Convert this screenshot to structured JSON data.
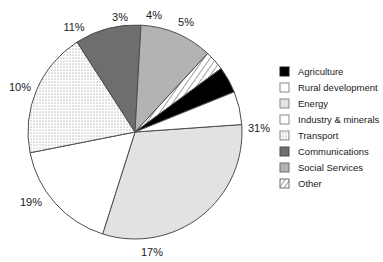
{
  "chart_data": {
    "type": "pie",
    "title": "",
    "legend_position": "right",
    "categories": [
      "Agriculture",
      "Rural development",
      "Energy",
      "Industry & minerals",
      "Transport",
      "Communications",
      "Social Services",
      "Other"
    ],
    "values": [
      4,
      5,
      31,
      17,
      19,
      10,
      11,
      3
    ],
    "value_labels": [
      "4%",
      "5%",
      "31%",
      "17%",
      "19%",
      "10%",
      "11%",
      "3%"
    ],
    "units": "percent",
    "total": 100,
    "slice_styles": [
      "solid-black",
      "white",
      "light-gray",
      "white",
      "dotted",
      "dark-gray",
      "medium-gray",
      "diagonal-hatch"
    ],
    "colors": {
      "agriculture": "#000000",
      "rural_development": "#ffffff",
      "energy": "#e2e2e2",
      "industry_minerals": "#ffffff",
      "transport": "#f2f2f2",
      "communications": "#6e6e6e",
      "social_services": "#b3b3b3",
      "other": "#ffffff",
      "outline": "#4d4d4d",
      "text": "#1a1a1a"
    },
    "start_angle_deg": -4,
    "direction": "clockwise"
  },
  "legend": {
    "items": [
      {
        "label": "Agriculture",
        "swatch": "solid-black-swatch"
      },
      {
        "label": "Rural development",
        "swatch": "white-swatch"
      },
      {
        "label": "Energy",
        "swatch": "light-gray-swatch"
      },
      {
        "label": "Industry & minerals",
        "swatch": "white-swatch"
      },
      {
        "label": "Transport",
        "swatch": "dotted-swatch"
      },
      {
        "label": "Communications",
        "swatch": "dark-gray-swatch"
      },
      {
        "label": "Social Services",
        "swatch": "medium-gray-swatch"
      },
      {
        "label": "Other",
        "swatch": "diagonal-hatch-swatch"
      }
    ]
  },
  "pie_labels": {
    "agriculture": "4%",
    "rural_development": "5%",
    "energy": "31%",
    "industry_minerals": "17%",
    "transport": "19%",
    "communications": "10%",
    "social_services": "11%",
    "other": "3%"
  }
}
